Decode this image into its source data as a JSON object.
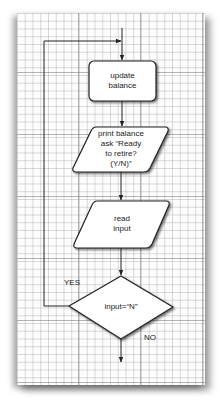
{
  "diagram": {
    "type": "flowchart",
    "nodes": [
      {
        "id": "update",
        "shape": "rounded-rectangle",
        "lines": [
          "update",
          "balance"
        ]
      },
      {
        "id": "print",
        "shape": "parallelogram",
        "lines": [
          "print balance",
          "ask “Ready",
          "to retire?",
          "(Y/N)”"
        ]
      },
      {
        "id": "read",
        "shape": "parallelogram",
        "lines": [
          "read",
          "input"
        ]
      },
      {
        "id": "decision",
        "shape": "diamond",
        "lines": [
          "input=“N”"
        ]
      }
    ],
    "edges": [
      {
        "from": "start",
        "to": "update"
      },
      {
        "from": "update",
        "to": "print"
      },
      {
        "from": "print",
        "to": "read"
      },
      {
        "from": "read",
        "to": "decision"
      },
      {
        "from": "decision",
        "to": "update",
        "label": "YES"
      },
      {
        "from": "decision",
        "to": "end",
        "label": "NO"
      }
    ],
    "yes_label": "YES",
    "no_label": "NO"
  },
  "colors": {
    "grid_minor": "#aaaaaa",
    "grid_major": "#787878",
    "stroke": "#222222",
    "box_fill": "#ffffff"
  }
}
